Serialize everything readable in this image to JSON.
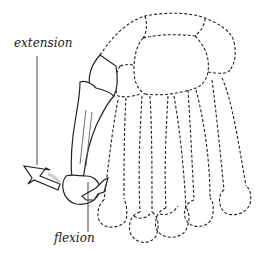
{
  "diagram": {
    "labels": {
      "extension": "extension",
      "flexion": "flexion"
    },
    "styles": {
      "line_color": "#222222",
      "background": "#ffffff"
    }
  }
}
